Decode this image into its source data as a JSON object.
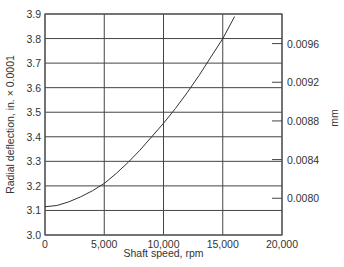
{
  "chart_data": {
    "type": "line",
    "title": "",
    "xlabel": "Shaft speed, rpm",
    "ylabel": "Radial deflection, in. × 0.0001",
    "y2label": "mm",
    "xlim": [
      0,
      20000
    ],
    "ylim": [
      3.0,
      3.9
    ],
    "grid": true,
    "x_ticks": [
      "0",
      "5,000",
      "10,000",
      "15,000",
      "20,000"
    ],
    "y_ticks": [
      "3.0",
      "3.1",
      "3.2",
      "3.3",
      "3.4",
      "3.5",
      "3.6",
      "3.7",
      "3.8",
      "3.9"
    ],
    "y2_ticks": [
      "0.0080",
      "0.0084",
      "0.0088",
      "0.0092",
      "0.0096"
    ],
    "series": [
      {
        "name": "Radial deflection",
        "x": [
          0,
          1000,
          2000,
          3000,
          4000,
          5000,
          6000,
          7000,
          8000,
          9000,
          10000,
          11000,
          12000,
          13000,
          14000,
          15000,
          16000
        ],
        "values": [
          3.115,
          3.12,
          3.135,
          3.155,
          3.18,
          3.21,
          3.25,
          3.295,
          3.345,
          3.4,
          3.455,
          3.515,
          3.58,
          3.65,
          3.725,
          3.8,
          3.89
        ]
      }
    ]
  }
}
